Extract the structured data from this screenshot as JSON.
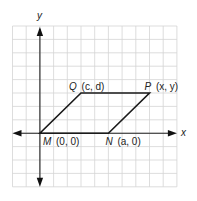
{
  "figure": {
    "type": "coordinate-plane-parallelogram",
    "grid": {
      "columns": 12,
      "rows": 12,
      "left": 12.5,
      "top": 26,
      "cell_w": 13.7,
      "cell_h": 13.4,
      "color": "#d4d4d4"
    },
    "axes": {
      "x_label": "x",
      "y_label": "y",
      "origin_col": 2,
      "origin_row": 8,
      "color": "#222222"
    },
    "parallelogram": {
      "vertices": [
        {
          "id": "M",
          "name": "M",
          "coords": "(0, 0)",
          "col": 2,
          "row": 8
        },
        {
          "id": "N",
          "name": "N",
          "coords": "(a, 0)",
          "col": 7,
          "row": 8
        },
        {
          "id": "P",
          "name": "P",
          "coords": "(x, y)",
          "col": 10,
          "row": 5
        },
        {
          "id": "Q",
          "name": "Q",
          "coords": "(c, d)",
          "col": 5,
          "row": 5
        }
      ],
      "labels": {
        "M": "M (0, 0)",
        "N": "N (a, 0)",
        "P": "P (x, y)",
        "Q": "Q (c, d)"
      },
      "edge_color": "#1a1a1a"
    }
  }
}
